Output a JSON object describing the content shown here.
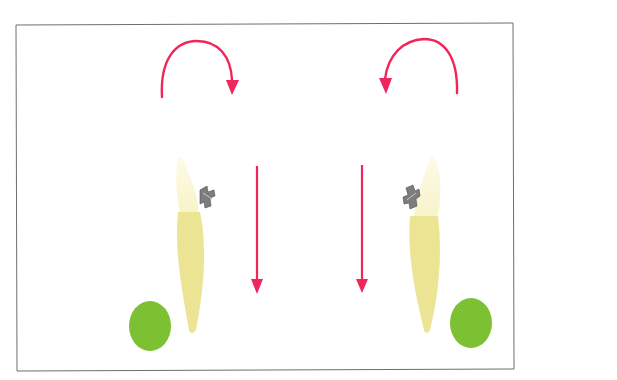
{
  "figure": {
    "colors": {
      "arrow": "#f0255a",
      "green_circle": "#7cc231",
      "frame": "#6e6e6e",
      "crown": "#fbf7d4",
      "root": "#ece48f",
      "bracket": "#7d7d7d"
    },
    "left_unit": {
      "rotation_arrow": "clockwise",
      "linear_arrow": "down"
    },
    "right_unit": {
      "rotation_arrow": "counter-clockwise",
      "linear_arrow": "down"
    }
  }
}
